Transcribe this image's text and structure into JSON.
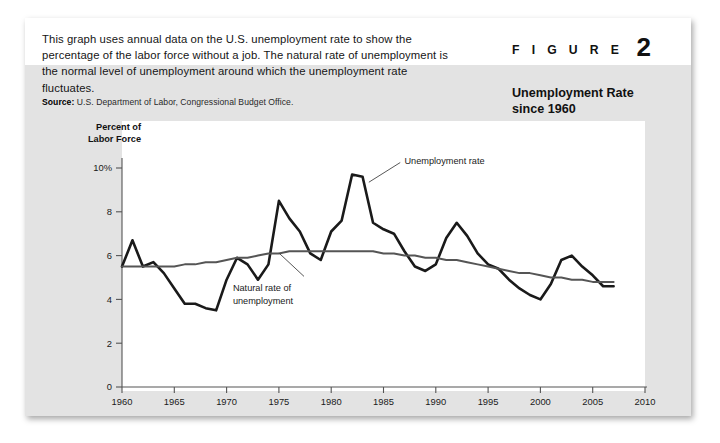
{
  "figure": {
    "word": "F I G U R E",
    "number": "2",
    "title": "Unemployment Rate since 1960",
    "title_line1": "Unemployment Rate",
    "title_line2": "since 1960",
    "intro": "This graph uses annual data on the U.S. unemployment rate to show the percentage of the labor force without a job. The natural rate of unemployment is the normal level of unemployment around which the unemployment rate fluctuates.",
    "source_label": "Source:",
    "source_text": "U.S. Department of Labor, Congressional Budget Office."
  },
  "colors": {
    "panel_background": "#e3e3e3",
    "header_band": "#ffffff",
    "chart_background": "#ffffff",
    "unemployment_line": "#1a1a1a",
    "natural_rate_line": "#555555",
    "axis": "#555555",
    "text": "#151515"
  },
  "chart_data": {
    "type": "line",
    "title": "Unemployment Rate since 1960",
    "xlabel": "",
    "ylabel": "Percent of Labor Force",
    "ylabel_line1": "Percent of",
    "ylabel_line2": "Labor Force",
    "xlim": [
      1960,
      2010
    ],
    "ylim": [
      0,
      11
    ],
    "grid": false,
    "legend_position": "inline-annotation",
    "yticks": [
      0,
      2,
      4,
      6,
      8,
      10
    ],
    "yticklabels": [
      "0",
      "2",
      "4",
      "6",
      "8",
      "10%"
    ],
    "xticks": [
      1960,
      1965,
      1970,
      1975,
      1980,
      1985,
      1990,
      1995,
      2000,
      2005,
      2010
    ],
    "xticklabels": [
      "1960",
      "1965",
      "1970",
      "1975",
      "1980",
      "1985",
      "1990",
      "1995",
      "2000",
      "2005",
      "2010"
    ],
    "x": [
      1960,
      1961,
      1962,
      1963,
      1964,
      1965,
      1966,
      1967,
      1968,
      1969,
      1970,
      1971,
      1972,
      1973,
      1974,
      1975,
      1976,
      1977,
      1978,
      1979,
      1980,
      1981,
      1982,
      1983,
      1984,
      1985,
      1986,
      1987,
      1988,
      1989,
      1990,
      1991,
      1992,
      1993,
      1994,
      1995,
      1996,
      1997,
      1998,
      1999,
      2000,
      2001,
      2002,
      2003,
      2004,
      2005,
      2006,
      2007
    ],
    "series": [
      {
        "name": "Unemployment rate",
        "annotation": "Unemployment rate",
        "color": "#1a1a1a",
        "width": 2.6,
        "values": [
          5.5,
          6.7,
          5.5,
          5.7,
          5.2,
          4.5,
          3.8,
          3.8,
          3.6,
          3.5,
          4.9,
          5.9,
          5.6,
          4.9,
          5.6,
          8.5,
          7.7,
          7.1,
          6.1,
          5.8,
          7.1,
          7.6,
          9.7,
          9.6,
          7.5,
          7.2,
          7.0,
          6.2,
          5.5,
          5.3,
          5.6,
          6.8,
          7.5,
          6.9,
          6.1,
          5.6,
          5.4,
          4.9,
          4.5,
          4.2,
          4.0,
          4.7,
          5.8,
          6.0,
          5.5,
          5.1,
          4.6,
          4.6
        ]
      },
      {
        "name": "Natural rate of unemployment",
        "annotation": "Natural rate of unemployment",
        "annotation_line1": "Natural rate of",
        "annotation_line2": "unemployment",
        "color": "#555555",
        "width": 2.0,
        "values": [
          5.5,
          5.5,
          5.5,
          5.5,
          5.5,
          5.5,
          5.6,
          5.6,
          5.7,
          5.7,
          5.8,
          5.9,
          5.9,
          6.0,
          6.1,
          6.1,
          6.2,
          6.2,
          6.2,
          6.2,
          6.2,
          6.2,
          6.2,
          6.2,
          6.2,
          6.1,
          6.1,
          6.0,
          6.0,
          5.9,
          5.9,
          5.8,
          5.8,
          5.7,
          5.6,
          5.5,
          5.4,
          5.3,
          5.2,
          5.2,
          5.1,
          5.0,
          5.0,
          4.9,
          4.9,
          4.8,
          4.8,
          4.8
        ]
      }
    ],
    "annotations": [
      {
        "text": "Unemployment rate",
        "x": 1987.5,
        "y": 9.6,
        "points_to_x": 1983,
        "points_to_y": 9.6
      },
      {
        "text": "Natural rate of unemployment",
        "x": 1981,
        "y": 4.4,
        "points_to_x": 1984.5,
        "points_to_y": 6.1
      }
    ]
  }
}
